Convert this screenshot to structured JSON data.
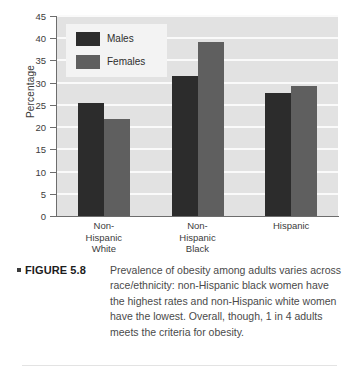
{
  "chart_data": {
    "type": "bar",
    "title": "",
    "xlabel": "",
    "ylabel": "Percentage",
    "ylim": [
      0,
      45
    ],
    "ytick_step": 5,
    "yticks": [
      0,
      5,
      10,
      15,
      20,
      25,
      30,
      35,
      40,
      45
    ],
    "grid": true,
    "legend_position": "upper-left-inside",
    "categories": [
      "Non-Hispanic White",
      "Non-Hispanic Black",
      "Hispanic"
    ],
    "category_lines": [
      [
        "Non-",
        "Hispanic",
        "White"
      ],
      [
        "Non-",
        "Hispanic",
        "Black"
      ],
      [
        "Hispanic"
      ]
    ],
    "series": [
      {
        "name": "Males",
        "color": "#2c2c2c",
        "values": [
          25.4,
          31.5,
          27.7
        ]
      },
      {
        "name": "Females",
        "color": "#5f5f5f",
        "values": [
          21.8,
          39.2,
          29.3
        ]
      }
    ]
  },
  "legend": {
    "items": [
      {
        "label": "Males"
      },
      {
        "label": "Females"
      }
    ]
  },
  "caption": {
    "label": "FIGURE 5.8",
    "text": "Prevalence of obesity among adults varies across race/ethnicity: non-Hispanic black women have the highest rates and non-Hispanic white women have the lowest. Overall, though, 1 in 4 adults meets the criteria for obesity."
  },
  "colors": {
    "plot_background": "#e2e2e2",
    "gridline": "#fafafa",
    "axis": "#6d6d6d",
    "males": "#2c2c2c",
    "females": "#5f5f5f",
    "page_background": "#ffffff"
  }
}
